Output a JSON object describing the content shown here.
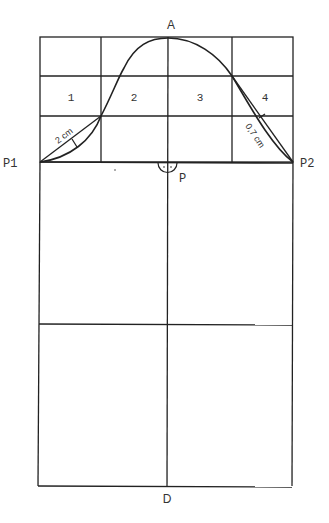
{
  "diagram": {
    "points": {
      "A": "A",
      "P1": "P1",
      "P2": "P2",
      "P": "P",
      "D": "D"
    },
    "grid_cells": [
      "1",
      "2",
      "3",
      "4"
    ],
    "measurements": {
      "left": "2 cm",
      "right": "0,7 cm"
    },
    "stroke_color": "#222222",
    "text_color": "#333333"
  }
}
